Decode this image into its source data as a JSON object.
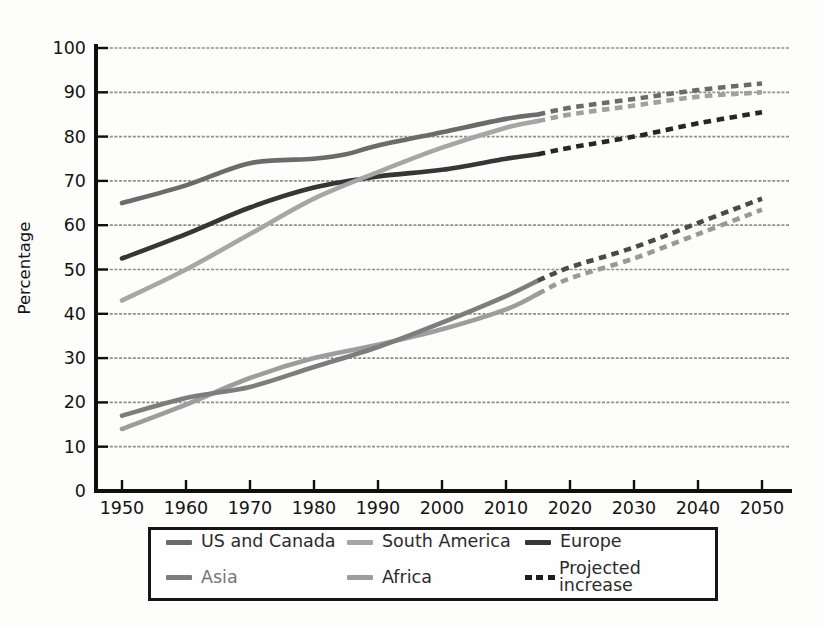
{
  "figure": {
    "ylabel": "Percentage"
  },
  "chart_data": {
    "type": "line",
    "title": "",
    "xlabel": "",
    "ylabel": "Percentage",
    "xlim": [
      1950,
      2050
    ],
    "ylim": [
      0,
      100
    ],
    "x_ticks": [
      1950,
      1960,
      1970,
      1980,
      1990,
      2000,
      2010,
      2020,
      2030,
      2040,
      2050
    ],
    "y_ticks": [
      0,
      10,
      20,
      30,
      40,
      50,
      60,
      70,
      80,
      90,
      100
    ],
    "grid": "horizontal",
    "projection_start_year": 2015,
    "axis_color": "#0f0f0f",
    "grid_color": "#8f8f8f",
    "series": [
      {
        "name": "US and Canada",
        "color": "#6b6b6b",
        "projected_color": "#6b6b6b",
        "label_color": "#2b2b2b",
        "solid": {
          "x": [
            1950,
            1960,
            1970,
            1980,
            1985,
            1990,
            2000,
            2010,
            2015
          ],
          "y": [
            65,
            69,
            74,
            75,
            76,
            78,
            81,
            84,
            85
          ]
        },
        "projected": {
          "x": [
            2015,
            2020,
            2030,
            2040,
            2050
          ],
          "y": [
            85,
            86.5,
            88.5,
            90.5,
            92
          ]
        }
      },
      {
        "name": "South America",
        "color": "#a6a6a6",
        "projected_color": "#a0a0a0",
        "label_color": "#2b2b2b",
        "solid": {
          "x": [
            1950,
            1960,
            1970,
            1980,
            1990,
            2000,
            2010,
            2015
          ],
          "y": [
            43,
            50,
            58,
            66,
            72,
            77.5,
            82,
            83.5
          ]
        },
        "projected": {
          "x": [
            2015,
            2020,
            2030,
            2040,
            2050
          ],
          "y": [
            83.5,
            85,
            87,
            89,
            90
          ]
        }
      },
      {
        "name": "Europe",
        "color": "#363636",
        "projected_color": "#262626",
        "label_color": "#2b2b2b",
        "solid": {
          "x": [
            1950,
            1960,
            1970,
            1980,
            1990,
            2000,
            2010,
            2015
          ],
          "y": [
            52.5,
            58,
            64,
            68.5,
            71,
            72.5,
            75,
            76
          ]
        },
        "projected": {
          "x": [
            2015,
            2020,
            2030,
            2040,
            2050
          ],
          "y": [
            76,
            77.5,
            80,
            83,
            85.5
          ]
        }
      },
      {
        "name": "Asia",
        "color": "#7d7d7d",
        "projected_color": "#4a4a4a",
        "label_color": "#767676",
        "solid": {
          "x": [
            1950,
            1960,
            1970,
            1980,
            1990,
            2000,
            2010,
            2015
          ],
          "y": [
            17,
            21,
            23.5,
            28,
            32.5,
            38,
            44,
            47.5
          ]
        },
        "projected": {
          "x": [
            2015,
            2020,
            2030,
            2040,
            2050
          ],
          "y": [
            47.5,
            50.5,
            55,
            60.5,
            66
          ]
        }
      },
      {
        "name": "Africa",
        "color": "#9d9d9d",
        "projected_color": "#999999",
        "label_color": "#2b2b2b",
        "solid": {
          "x": [
            1950,
            1960,
            1970,
            1980,
            1990,
            2000,
            2010,
            2015
          ],
          "y": [
            14,
            19.5,
            25.5,
            30,
            33,
            36.5,
            41,
            44.5
          ]
        },
        "projected": {
          "x": [
            2015,
            2020,
            2030,
            2040,
            2050
          ],
          "y": [
            44.5,
            48,
            52.5,
            58,
            63.5
          ]
        }
      }
    ],
    "legend": {
      "position": "bottom",
      "projected_label": "Projected increase",
      "projected_color": "#1f1f1f"
    }
  }
}
